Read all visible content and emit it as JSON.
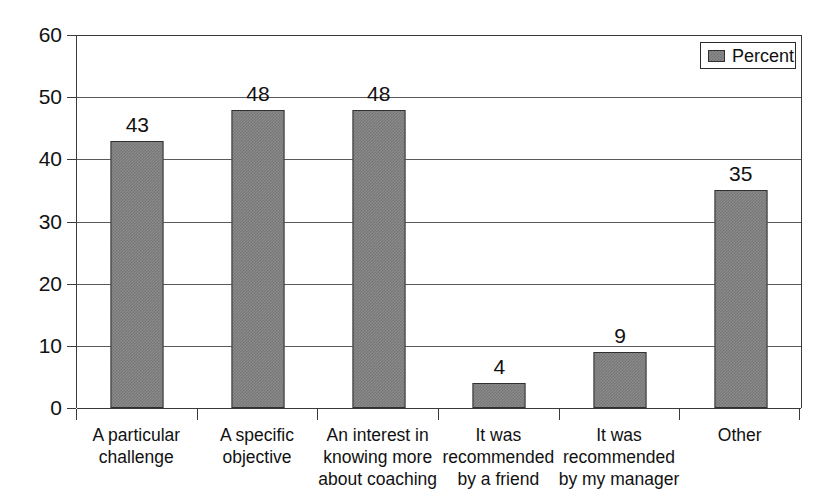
{
  "chart_data": {
    "type": "bar",
    "title": "",
    "subtitle": "",
    "xlabel": "",
    "ylabel": "",
    "ylim": [
      0,
      60
    ],
    "yticks": [
      0,
      10,
      20,
      30,
      40,
      50,
      60
    ],
    "ytick_labels": [
      "0",
      "10",
      "20",
      "30",
      "40",
      "50",
      "60"
    ],
    "grid": true,
    "legend_position": "top-right",
    "categories": [
      "A particular challenge",
      "A specific objective",
      "An interest in knowing more about coaching",
      "It was recommended by a friend",
      "It was recommended by my manager",
      "Other"
    ],
    "category_lines": [
      [
        "A particular",
        "challenge"
      ],
      [
        "A specific",
        "objective"
      ],
      [
        "An interest in",
        "knowing more",
        "about coaching"
      ],
      [
        "It was",
        "recommended",
        "by a friend"
      ],
      [
        "It was",
        "recommended",
        "by my manager"
      ],
      [
        "Other"
      ]
    ],
    "series": [
      {
        "name": "Percent",
        "values": [
          43,
          48,
          48,
          4,
          9,
          35
        ],
        "color": "#8c8c8c"
      }
    ],
    "data_labels": [
      "43",
      "48",
      "48",
      "4",
      "9",
      "35"
    ]
  },
  "legend": {
    "entries": [
      {
        "label": "Percent",
        "swatch_name": "legend-swatch-percent"
      }
    ]
  },
  "axis": {
    "y_tick_labels": [
      "60",
      "50",
      "40",
      "30",
      "20",
      "10",
      "0"
    ]
  },
  "colors": {
    "bar_fill": "#8c8c8c",
    "bar_edge": "#303030",
    "axis": "#3a3a3a",
    "gridline": "#5a5a5a",
    "text": "#111111",
    "background": "#ffffff"
  }
}
